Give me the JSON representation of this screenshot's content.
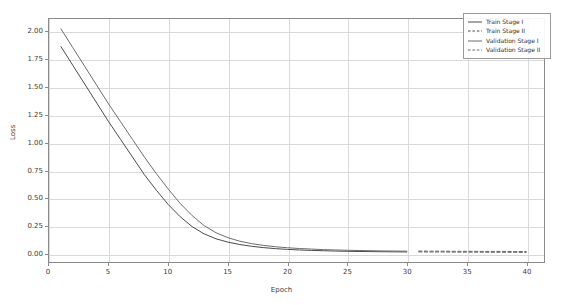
{
  "chart_data": {
    "type": "line",
    "title": "",
    "xlabel": "Epoch",
    "ylabel": "Loss",
    "xlim": [
      0,
      41.5
    ],
    "ylim": [
      -0.08,
      2.12
    ],
    "grid": true,
    "legend_position": "upper right",
    "xticks": [
      "0",
      "5",
      "10",
      "15",
      "20",
      "25",
      "30",
      "35",
      "40"
    ],
    "xtick_values": [
      0,
      5,
      10,
      15,
      20,
      25,
      30,
      35,
      40
    ],
    "yticks": [
      "0.00",
      "0.25",
      "0.50",
      "0.75",
      "1.00",
      "1.25",
      "1.50",
      "1.75",
      "2.00"
    ],
    "ytick_values": [
      0.0,
      0.25,
      0.5,
      0.75,
      1.0,
      1.25,
      1.5,
      1.75,
      2.0
    ],
    "series": [
      {
        "name": "Train Stage I",
        "style": "solid",
        "color": "#4a4a4a",
        "x": [
          1,
          2,
          3,
          4,
          5,
          6,
          7,
          8,
          9,
          10,
          11,
          12,
          13,
          14,
          15,
          16,
          17,
          18,
          19,
          20,
          21,
          22,
          23,
          24,
          25,
          26,
          27,
          28,
          29,
          30
        ],
        "values": [
          1.87,
          1.7,
          1.53,
          1.36,
          1.19,
          1.03,
          0.87,
          0.71,
          0.57,
          0.44,
          0.33,
          0.24,
          0.175,
          0.13,
          0.1,
          0.078,
          0.062,
          0.05,
          0.041,
          0.034,
          0.029,
          0.025,
          0.022,
          0.019,
          0.017,
          0.015,
          0.014,
          0.013,
          0.012,
          0.011
        ]
      },
      {
        "name": "Train Stage II",
        "style": "dashed",
        "color": "#4a4a4a",
        "x": [
          31,
          32,
          33,
          34,
          35,
          36,
          37,
          38,
          39,
          40
        ],
        "values": [
          0.012,
          0.011,
          0.011,
          0.01,
          0.01,
          0.01,
          0.009,
          0.009,
          0.009,
          0.008
        ]
      },
      {
        "name": "Validation Stage I",
        "style": "solid",
        "color": "#6b6b6b",
        "x": [
          1,
          2,
          3,
          4,
          5,
          6,
          7,
          8,
          9,
          10,
          11,
          12,
          13,
          14,
          15,
          16,
          17,
          18,
          19,
          20,
          21,
          22,
          23,
          24,
          25,
          26,
          27,
          28,
          29,
          30
        ],
        "values": [
          2.03,
          1.86,
          1.69,
          1.52,
          1.35,
          1.19,
          1.03,
          0.87,
          0.72,
          0.58,
          0.45,
          0.34,
          0.25,
          0.185,
          0.14,
          0.108,
          0.086,
          0.07,
          0.058,
          0.049,
          0.042,
          0.037,
          0.032,
          0.029,
          0.026,
          0.024,
          0.022,
          0.02,
          0.019,
          0.018
        ]
      },
      {
        "name": "Validation Stage II",
        "style": "dashed",
        "color": "#6b6b6b",
        "x": [
          31,
          32,
          33,
          34,
          35,
          36,
          37,
          38,
          39,
          40
        ],
        "values": [
          0.019,
          0.018,
          0.018,
          0.017,
          0.017,
          0.016,
          0.016,
          0.016,
          0.015,
          0.015
        ]
      }
    ]
  },
  "legend": {
    "items": [
      {
        "label": "Train Stage I",
        "style": "solid",
        "color": "#4a4a4a"
      },
      {
        "label": "Train Stage II",
        "style": "dashed",
        "color": "#4a4a4a"
      },
      {
        "label": "Validation Stage I",
        "style": "solid",
        "color": "#6b6b6b"
      },
      {
        "label": "Validation Stage II",
        "style": "dashed",
        "color": "#6b6b6b"
      }
    ]
  },
  "axes": {
    "xlabel": "Epoch",
    "ylabel": "Loss"
  }
}
